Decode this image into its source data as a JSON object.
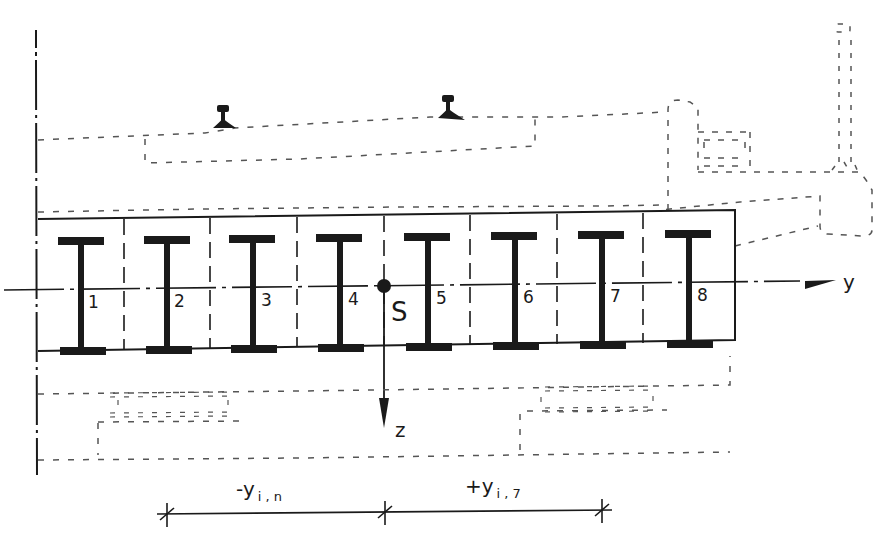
{
  "diagram": {
    "colors": {
      "ink": "#1a1a1a",
      "hidden_line": "#555555",
      "background": "#ffffff"
    },
    "girders": [
      {
        "id": 1,
        "label": "1"
      },
      {
        "id": 2,
        "label": "2"
      },
      {
        "id": 3,
        "label": "3"
      },
      {
        "id": 4,
        "label": "4"
      },
      {
        "id": 5,
        "label": "5"
      },
      {
        "id": 6,
        "label": "6"
      },
      {
        "id": 7,
        "label": "7"
      },
      {
        "id": 8,
        "label": "8"
      }
    ],
    "centroid": {
      "label": "S"
    },
    "axes": {
      "y_label": "y",
      "z_label": "z"
    },
    "dimensions": {
      "left": {
        "sign": "-",
        "var": "y",
        "sub": "i , n"
      },
      "right": {
        "sign": "+",
        "var": "y",
        "sub": "i , 7"
      }
    },
    "rails": [
      {
        "name": "rail-left"
      },
      {
        "name": "rail-right"
      }
    ]
  }
}
